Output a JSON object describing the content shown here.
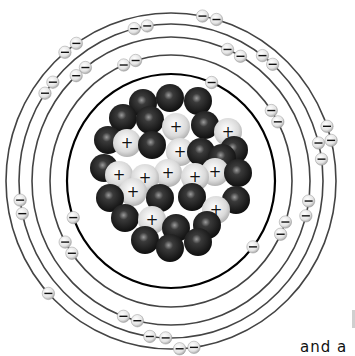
{
  "diagram": {
    "center": [
      171,
      181
    ],
    "colors": {
      "orbit": "#444444",
      "inner_orbit": "#000000",
      "neutron": "#1a1a1a",
      "proton": "#d9d9d9",
      "electron": "#e6e6e6",
      "background": "#ffffff"
    },
    "orbits": [
      {
        "name": "shell-1",
        "rx": 104,
        "ry": 107,
        "stroke": 2.2,
        "color": "#000000"
      },
      {
        "name": "shell-2",
        "rx": 121,
        "ry": 126,
        "stroke": 1.6,
        "color": "#444444"
      },
      {
        "name": "shell-3",
        "rx": 139,
        "ry": 144,
        "stroke": 1.6,
        "color": "#444444"
      },
      {
        "name": "shell-4",
        "rx": 152,
        "ry": 157,
        "stroke": 1.6,
        "color": "#444444"
      },
      {
        "name": "shell-5",
        "rx": 165,
        "ry": 168,
        "stroke": 1.6,
        "color": "#444444"
      }
    ],
    "electron_symbol": "−",
    "proton_symbol": "+",
    "electrons": [
      {
        "orbit": 0,
        "angle": 200
      },
      {
        "orbit": 0,
        "angle": 322
      },
      {
        "orbit": 0,
        "angle": 67
      },
      {
        "orbit": 1,
        "angle": 215
      },
      {
        "orbit": 1,
        "angle": 209
      },
      {
        "orbit": 1,
        "angle": 107
      },
      {
        "orbit": 1,
        "angle": 113
      },
      {
        "orbit": 1,
        "angle": 335
      },
      {
        "orbit": 1,
        "angle": 341
      },
      {
        "orbit": 1,
        "angle": 28
      },
      {
        "orbit": 1,
        "angle": 34
      },
      {
        "orbit": 2,
        "angle": 128
      },
      {
        "orbit": 2,
        "angle": 133
      },
      {
        "orbit": 2,
        "angle": 250
      },
      {
        "orbit": 2,
        "angle": 256
      },
      {
        "orbit": 2,
        "angle": 346
      },
      {
        "orbit": 2,
        "angle": 352
      },
      {
        "orbit": 2,
        "angle": 60
      },
      {
        "orbit": 2,
        "angle": 66
      },
      {
        "orbit": 3,
        "angle": 192
      },
      {
        "orbit": 3,
        "angle": 187
      },
      {
        "orbit": 3,
        "angle": 141
      },
      {
        "orbit": 3,
        "angle": 146
      },
      {
        "orbit": 3,
        "angle": 262
      },
      {
        "orbit": 3,
        "angle": 268
      },
      {
        "orbit": 3,
        "angle": 8
      },
      {
        "orbit": 3,
        "angle": 14
      },
      {
        "orbit": 3,
        "angle": 48
      },
      {
        "orbit": 3,
        "angle": 53
      },
      {
        "orbit": 3,
        "angle": 99
      },
      {
        "orbit": 3,
        "angle": 104
      },
      {
        "orbit": 4,
        "angle": 222
      },
      {
        "orbit": 4,
        "angle": 125
      },
      {
        "orbit": 4,
        "angle": 130
      },
      {
        "orbit": 4,
        "angle": 273
      },
      {
        "orbit": 4,
        "angle": 278
      },
      {
        "orbit": 4,
        "angle": 14
      },
      {
        "orbit": 4,
        "angle": 19
      },
      {
        "orbit": 4,
        "angle": 74
      },
      {
        "orbit": 4,
        "angle": 79
      }
    ],
    "nucleus": {
      "particles": [
        {
          "x": 143,
          "y": 103,
          "t": "n"
        },
        {
          "x": 170,
          "y": 98,
          "t": "n"
        },
        {
          "x": 198,
          "y": 101,
          "t": "n"
        },
        {
          "x": 123,
          "y": 118,
          "t": "n"
        },
        {
          "x": 150,
          "y": 120,
          "t": "n"
        },
        {
          "x": 176,
          "y": 127,
          "t": "p"
        },
        {
          "x": 205,
          "y": 125,
          "t": "n"
        },
        {
          "x": 228,
          "y": 132,
          "t": "p"
        },
        {
          "x": 108,
          "y": 140,
          "t": "n"
        },
        {
          "x": 127,
          "y": 143,
          "t": "p"
        },
        {
          "x": 152,
          "y": 145,
          "t": "n"
        },
        {
          "x": 180,
          "y": 152,
          "t": "p"
        },
        {
          "x": 201,
          "y": 152,
          "t": "n"
        },
        {
          "x": 222,
          "y": 158,
          "t": "n"
        },
        {
          "x": 234,
          "y": 150,
          "t": "n"
        },
        {
          "x": 104,
          "y": 168,
          "t": "n"
        },
        {
          "x": 119,
          "y": 175,
          "t": "p"
        },
        {
          "x": 145,
          "y": 178,
          "t": "p"
        },
        {
          "x": 168,
          "y": 173,
          "t": "p"
        },
        {
          "x": 195,
          "y": 177,
          "t": "p"
        },
        {
          "x": 215,
          "y": 172,
          "t": "p"
        },
        {
          "x": 238,
          "y": 173,
          "t": "n"
        },
        {
          "x": 110,
          "y": 198,
          "t": "n"
        },
        {
          "x": 133,
          "y": 192,
          "t": "p"
        },
        {
          "x": 160,
          "y": 198,
          "t": "n"
        },
        {
          "x": 192,
          "y": 197,
          "t": "n"
        },
        {
          "x": 216,
          "y": 210,
          "t": "p"
        },
        {
          "x": 236,
          "y": 200,
          "t": "n"
        },
        {
          "x": 125,
          "y": 218,
          "t": "n"
        },
        {
          "x": 152,
          "y": 220,
          "t": "p"
        },
        {
          "x": 176,
          "y": 228,
          "t": "n"
        },
        {
          "x": 207,
          "y": 225,
          "t": "n"
        },
        {
          "x": 145,
          "y": 240,
          "t": "n"
        },
        {
          "x": 170,
          "y": 248,
          "t": "n"
        },
        {
          "x": 198,
          "y": 242,
          "t": "n"
        }
      ]
    },
    "caption": "and a"
  }
}
